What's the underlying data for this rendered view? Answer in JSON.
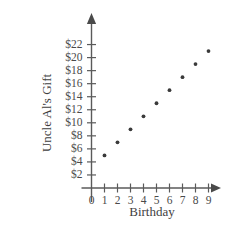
{
  "chart_data": {
    "type": "scatter",
    "title": "",
    "xlabel": "Birthday",
    "ylabel": "Uncle Al's Gift",
    "x": [
      1,
      2,
      3,
      4,
      5,
      6,
      7,
      8,
      9
    ],
    "values": [
      5,
      7,
      9,
      11,
      13,
      15,
      17,
      19,
      21
    ],
    "points": [
      {
        "x": 1,
        "y": 5
      },
      {
        "x": 2,
        "y": 7
      },
      {
        "x": 3,
        "y": 9
      },
      {
        "x": 4,
        "y": 11
      },
      {
        "x": 5,
        "y": 13
      },
      {
        "x": 6,
        "y": 15
      },
      {
        "x": 7,
        "y": 17
      },
      {
        "x": 8,
        "y": 19
      },
      {
        "x": 9,
        "y": 21
      }
    ],
    "xlim": [
      0,
      9.8
    ],
    "ylim": [
      0,
      23
    ],
    "xticks": [
      0,
      1,
      2,
      3,
      4,
      5,
      6,
      7,
      8,
      9
    ],
    "xticklabels": [
      "0",
      "1",
      "2",
      "3",
      "4",
      "5",
      "6",
      "7",
      "8",
      "9"
    ],
    "yticks": [
      2,
      4,
      6,
      8,
      10,
      12,
      14,
      16,
      18,
      20,
      22
    ],
    "yticklabels": [
      "$2",
      "$4",
      "$6",
      "$8",
      "$10",
      "$12",
      "$14",
      "$16",
      "$18",
      "$20",
      "$22"
    ],
    "grid": false,
    "legend": null,
    "marker_color": "#3a3a3a",
    "axis_color": "#5a5a5a",
    "text_color": "#4a4a4a",
    "background": "#ffffff"
  }
}
